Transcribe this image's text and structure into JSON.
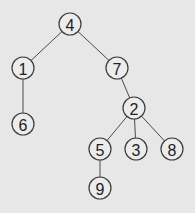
{
  "diagram": {
    "type": "tree",
    "nodes": [
      {
        "id": "n4",
        "label": "4",
        "x": 70,
        "y": 24
      },
      {
        "id": "n1",
        "label": "1",
        "x": 23,
        "y": 68
      },
      {
        "id": "n7",
        "label": "7",
        "x": 117,
        "y": 68
      },
      {
        "id": "n6",
        "label": "6",
        "x": 23,
        "y": 124
      },
      {
        "id": "n2",
        "label": "2",
        "x": 134,
        "y": 108
      },
      {
        "id": "n5",
        "label": "5",
        "x": 100,
        "y": 149
      },
      {
        "id": "n3",
        "label": "3",
        "x": 136,
        "y": 149
      },
      {
        "id": "n8",
        "label": "8",
        "x": 172,
        "y": 149
      },
      {
        "id": "n9",
        "label": "9",
        "x": 100,
        "y": 188
      }
    ],
    "edges": [
      {
        "from": "n4",
        "to": "n1"
      },
      {
        "from": "n4",
        "to": "n7"
      },
      {
        "from": "n1",
        "to": "n6"
      },
      {
        "from": "n7",
        "to": "n2"
      },
      {
        "from": "n2",
        "to": "n5"
      },
      {
        "from": "n2",
        "to": "n3"
      },
      {
        "from": "n2",
        "to": "n8"
      },
      {
        "from": "n5",
        "to": "n9"
      }
    ],
    "node_radius": 11,
    "colors": {
      "background": "#e7e7e7",
      "node_fill": "#ececec",
      "stroke": "#3c3c3c"
    }
  }
}
